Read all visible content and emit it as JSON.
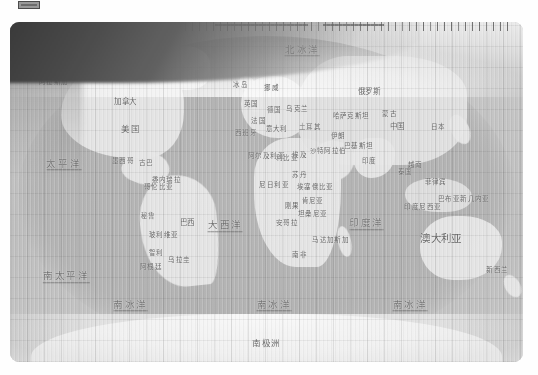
{
  "page": {
    "background_color": "#ffffff",
    "top_marker": {
      "name": "scan-marker",
      "label": ""
    }
  },
  "map": {
    "kind": "scanned-world-map",
    "projection": "oval / globe-like world projection",
    "bounds_px": {
      "x": 10,
      "y": 22,
      "width": 513,
      "height": 340
    },
    "land_color": "#e9ebe6",
    "ocean_color": "#b4b8b1",
    "paper_color": "#d2d5cf",
    "label_color": "#5d5f5b",
    "artifacts": [
      "dark scan shadow top-left",
      "vertical scanner banding",
      "tick marks along top edge"
    ],
    "continents": [
      {
        "label": "加拿大",
        "x": 22.5,
        "y": 23.5,
        "size": "s8"
      },
      {
        "label": "美国",
        "x": 23.5,
        "y": 31.5,
        "size": "s9"
      },
      {
        "label": "格陵兰",
        "x": 25.5,
        "y": 14.0,
        "size": "s7"
      },
      {
        "label": "阿拉斯加",
        "x": 8.5,
        "y": 17.5,
        "size": "s7"
      },
      {
        "label": "墨西哥",
        "x": 22.0,
        "y": 41.0,
        "size": "s7"
      },
      {
        "label": "巴西",
        "x": 34.5,
        "y": 59.0,
        "size": "s8"
      },
      {
        "label": "阿根廷",
        "x": 27.5,
        "y": 72.0,
        "size": "s7"
      },
      {
        "label": "秘鲁",
        "x": 27.0,
        "y": 57.0,
        "size": "s7"
      },
      {
        "label": "智利",
        "x": 28.5,
        "y": 68.0,
        "size": "s7"
      },
      {
        "label": "哥伦比亚",
        "x": 29.0,
        "y": 48.5,
        "size": "s7"
      },
      {
        "label": "俄罗斯",
        "x": 70.0,
        "y": 20.5,
        "size": "s8"
      },
      {
        "label": "中国",
        "x": 75.5,
        "y": 31.0,
        "size": "s8"
      },
      {
        "label": "蒙古",
        "x": 74.0,
        "y": 27.0,
        "size": "s7"
      },
      {
        "label": "印度",
        "x": 70.0,
        "y": 41.0,
        "size": "s7"
      },
      {
        "label": "哈萨克斯坦",
        "x": 66.5,
        "y": 27.5,
        "size": "s7"
      },
      {
        "label": "日本",
        "x": 83.5,
        "y": 31.0,
        "size": "s7"
      },
      {
        "label": "沙特阿拉伯",
        "x": 62.0,
        "y": 38.0,
        "size": "s7"
      },
      {
        "label": "伊朗",
        "x": 64.0,
        "y": 33.5,
        "size": "s7"
      },
      {
        "label": "土耳其",
        "x": 58.5,
        "y": 31.0,
        "size": "s7"
      },
      {
        "label": "埃及",
        "x": 56.5,
        "y": 39.0,
        "size": "s7"
      },
      {
        "label": "阿尔及利亚",
        "x": 50.0,
        "y": 39.5,
        "size": "s7"
      },
      {
        "label": "利比亚",
        "x": 54.0,
        "y": 40.0,
        "size": "s7"
      },
      {
        "label": "苏丹",
        "x": 56.5,
        "y": 45.0,
        "size": "s7"
      },
      {
        "label": "尼日利亚",
        "x": 51.5,
        "y": 48.0,
        "size": "s7"
      },
      {
        "label": "埃塞俄比亚",
        "x": 59.5,
        "y": 48.5,
        "size": "s7"
      },
      {
        "label": "刚果",
        "x": 55.0,
        "y": 54.0,
        "size": "s7"
      },
      {
        "label": "安哥拉",
        "x": 54.0,
        "y": 59.0,
        "size": "s7"
      },
      {
        "label": "南非",
        "x": 56.5,
        "y": 68.5,
        "size": "s7"
      },
      {
        "label": "马达加斯加",
        "x": 62.5,
        "y": 64.0,
        "size": "s7"
      },
      {
        "label": "澳大利亚",
        "x": 84.0,
        "y": 63.5,
        "size": "s11"
      },
      {
        "label": "新西兰",
        "x": 95.0,
        "y": 73.0,
        "size": "s7"
      },
      {
        "label": "印度尼西亚",
        "x": 80.5,
        "y": 54.5,
        "size": "s7"
      },
      {
        "label": "菲律宾",
        "x": 83.0,
        "y": 47.0,
        "size": "s7"
      },
      {
        "label": "南极洲",
        "x": 50.0,
        "y": 94.5,
        "size": "s9"
      },
      {
        "label": "冰岛",
        "x": 45.0,
        "y": 18.5,
        "size": "s7"
      },
      {
        "label": "英国",
        "x": 47.0,
        "y": 24.0,
        "size": "s7"
      },
      {
        "label": "法国",
        "x": 48.5,
        "y": 29.0,
        "size": "s7"
      },
      {
        "label": "西班牙",
        "x": 46.0,
        "y": 32.5,
        "size": "s7"
      },
      {
        "label": "德国",
        "x": 51.5,
        "y": 26.0,
        "size": "s7"
      },
      {
        "label": "意大利",
        "x": 52.0,
        "y": 31.5,
        "size": "s7"
      },
      {
        "label": "巴布亚新几内亚",
        "x": 88.5,
        "y": 52.0,
        "size": "s7"
      },
      {
        "label": "巴基斯坦",
        "x": 68.0,
        "y": 36.5,
        "size": "s7"
      },
      {
        "label": "泰国",
        "x": 77.0,
        "y": 44.0,
        "size": "s7"
      },
      {
        "label": "越南",
        "x": 79.0,
        "y": 42.0,
        "size": "s7"
      },
      {
        "label": "肯尼亚",
        "x": 59.0,
        "y": 52.5,
        "size": "s7"
      },
      {
        "label": "坦桑尼亚",
        "x": 59.0,
        "y": 56.5,
        "size": "s7"
      },
      {
        "label": "乌克兰",
        "x": 56.0,
        "y": 25.5,
        "size": "s7"
      },
      {
        "label": "挪威",
        "x": 51.0,
        "y": 19.5,
        "size": "s7"
      },
      {
        "label": "古巴",
        "x": 26.5,
        "y": 41.5,
        "size": "s7"
      },
      {
        "label": "委内瑞拉",
        "x": 30.5,
        "y": 46.5,
        "size": "s7"
      },
      {
        "label": "玻利维亚",
        "x": 30.0,
        "y": 62.5,
        "size": "s7"
      },
      {
        "label": "乌拉圭",
        "x": 33.0,
        "y": 70.0,
        "size": "s7"
      }
    ],
    "oceans": [
      {
        "label": "太平洋",
        "x": 10.5,
        "y": 42.0,
        "size": "s9"
      },
      {
        "label": "大西洋",
        "x": 42.0,
        "y": 60.0,
        "size": "s9"
      },
      {
        "label": "印度洋",
        "x": 69.5,
        "y": 59.5,
        "size": "s9"
      },
      {
        "label": "北冰洋",
        "x": 57.0,
        "y": 8.5,
        "size": "s8"
      },
      {
        "label": "南太平洋",
        "x": 11.0,
        "y": 75.0,
        "size": "s8"
      },
      {
        "label": "南冰洋",
        "x": 23.5,
        "y": 83.5,
        "size": "s9"
      },
      {
        "label": "南冰洋",
        "x": 51.5,
        "y": 83.5,
        "size": "s9"
      },
      {
        "label": "南冰洋",
        "x": 78.0,
        "y": 83.5,
        "size": "s9"
      }
    ]
  }
}
